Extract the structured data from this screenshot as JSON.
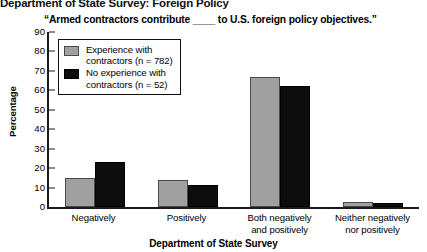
{
  "header": {
    "title": "Department of State Survey: Foreign Policy"
  },
  "subtitle": "“Armed contractors contribute ____ to U.S. foreign policy objectives.”",
  "legend": {
    "entries": [
      {
        "label_line1": "Experience with",
        "label_line2": "contractors (n = 782)",
        "color": "#a0a0a0"
      },
      {
        "label_line1": "No experience with",
        "label_line2": "contractors (n = 52)",
        "color": "#0d0d0d"
      }
    ]
  },
  "chart_data": {
    "type": "bar",
    "title": "Department of State Survey: Foreign Policy",
    "subtitle": "“Armed contractors contribute ____ to U.S. foreign policy objectives.”",
    "xlabel": "Department of State Survey",
    "ylabel": "Percentage",
    "ylim": [
      0,
      90
    ],
    "yticks": [
      0,
      10,
      20,
      30,
      40,
      50,
      60,
      70,
      80,
      90
    ],
    "ytick_labels": [
      "0",
      "10",
      "20",
      "30",
      "40",
      "50",
      "60",
      "70",
      "80",
      "90"
    ],
    "grid": false,
    "legend_position": "upper-left-inside",
    "categories": [
      "Negatively",
      "Positively",
      "Both negatively\nand positively",
      "Neither negatively\nnor positively"
    ],
    "category_lines": [
      [
        "Negatively",
        ""
      ],
      [
        "Positively",
        ""
      ],
      [
        "Both negatively",
        "and positively"
      ],
      [
        "Neither negatively",
        "nor positively"
      ]
    ],
    "series": [
      {
        "name": "Experience with contractors (n = 782)",
        "color": "#a0a0a0",
        "values": [
          15,
          14,
          67,
          2.5
        ]
      },
      {
        "name": "No experience with contractors (n = 52)",
        "color": "#0d0d0d",
        "values": [
          23,
          11.5,
          62,
          2
        ]
      }
    ]
  }
}
